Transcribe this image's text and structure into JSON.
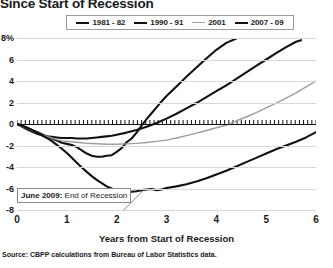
{
  "title": "Since Start of Recession",
  "legend": {
    "position": "top-center",
    "items": [
      {
        "label": "1981 - 82",
        "color": "#111111",
        "width": 2.2
      },
      {
        "label": "1990 - 91",
        "color": "#111111",
        "width": 2.2
      },
      {
        "label": "2001",
        "color": "#9d9d9d",
        "width": 1.6
      },
      {
        "label": "2007 - 09",
        "color": "#111111",
        "width": 2.2
      }
    ]
  },
  "annotation": {
    "bold": "June 2009:",
    "text": " End of Recession"
  },
  "xaxis_title": "Years from Start of Recession",
  "source": "Source: CBPP calculations from Bureau of Labor Statistics data.",
  "chart_data": {
    "type": "line",
    "title": "Since Start of Recession",
    "xlabel": "Years from Start of Recession",
    "ylabel": "",
    "xlim": [
      0,
      6
    ],
    "ylim": [
      -8,
      8
    ],
    "xticks": [
      0,
      1,
      2,
      3,
      4,
      5,
      6
    ],
    "xticklabels": [
      "0",
      "1",
      "2",
      "3",
      "4",
      "5",
      "6"
    ],
    "yticks": [
      -8,
      -6,
      -4,
      -2,
      0,
      2,
      4,
      6,
      8
    ],
    "yticklabels": [
      "-8",
      "-6",
      "-4",
      "-2",
      "0",
      "2",
      "4",
      "6",
      "8%"
    ],
    "grid": true,
    "units": "percent change in payroll employment",
    "series": [
      {
        "name": "1981 - 82",
        "color": "#111111",
        "x": [
          0.0,
          0.1,
          0.2,
          0.3,
          0.4,
          0.5,
          0.6,
          0.7,
          0.8,
          0.9,
          1.0,
          1.1,
          1.2,
          1.3,
          1.4,
          1.5,
          1.6,
          1.7,
          1.8,
          1.9,
          2.0,
          2.1,
          2.2,
          2.3,
          2.4,
          2.5,
          2.6,
          2.7,
          2.8,
          2.9,
          3.0,
          3.2,
          3.4,
          3.6,
          3.8,
          4.0,
          4.2,
          4.4
        ],
        "y": [
          0.0,
          -0.15,
          -0.35,
          -0.55,
          -0.75,
          -0.95,
          -1.15,
          -1.35,
          -1.55,
          -1.75,
          -1.85,
          -1.95,
          -2.15,
          -2.45,
          -2.75,
          -2.95,
          -3.05,
          -3.05,
          -2.95,
          -2.9,
          -2.6,
          -2.25,
          -1.7,
          -1.35,
          -0.8,
          -0.15,
          0.45,
          1.0,
          1.55,
          2.1,
          2.6,
          3.5,
          4.4,
          5.25,
          6.1,
          6.9,
          7.55,
          7.95
        ]
      },
      {
        "name": "1990 - 91",
        "color": "#111111",
        "x": [
          0.0,
          0.1,
          0.2,
          0.3,
          0.4,
          0.5,
          0.6,
          0.7,
          0.8,
          0.9,
          1.0,
          1.1,
          1.2,
          1.3,
          1.4,
          1.5,
          1.6,
          1.7,
          1.8,
          1.9,
          2.0,
          2.2,
          2.4,
          2.6,
          2.8,
          3.0,
          3.2,
          3.4,
          3.6,
          3.8,
          4.0,
          4.2,
          4.4,
          4.6,
          4.8,
          5.0,
          5.2,
          5.4,
          5.6,
          5.7
        ],
        "y": [
          0.0,
          -0.25,
          -0.5,
          -0.7,
          -0.9,
          -1.05,
          -1.15,
          -1.2,
          -1.25,
          -1.3,
          -1.3,
          -1.3,
          -1.35,
          -1.35,
          -1.35,
          -1.3,
          -1.25,
          -1.2,
          -1.15,
          -1.1,
          -1.0,
          -0.8,
          -0.55,
          -0.25,
          0.1,
          0.5,
          0.95,
          1.45,
          1.95,
          2.5,
          3.05,
          3.6,
          4.2,
          4.8,
          5.4,
          6.0,
          6.6,
          7.15,
          7.65,
          7.8
        ]
      },
      {
        "name": "2001",
        "color": "#9d9d9d",
        "x": [
          0.0,
          0.1,
          0.2,
          0.3,
          0.4,
          0.5,
          0.6,
          0.7,
          0.8,
          0.9,
          1.0,
          1.1,
          1.2,
          1.3,
          1.4,
          1.5,
          1.6,
          1.7,
          1.8,
          1.9,
          2.0,
          2.2,
          2.4,
          2.6,
          2.8,
          3.0,
          3.2,
          3.4,
          3.6,
          3.8,
          4.0,
          4.2,
          4.4,
          4.6,
          4.8,
          5.0,
          5.2,
          5.4,
          5.6,
          5.8,
          6.0
        ],
        "y": [
          0.0,
          -0.2,
          -0.4,
          -0.6,
          -0.8,
          -1.0,
          -1.15,
          -1.3,
          -1.45,
          -1.55,
          -1.6,
          -1.65,
          -1.7,
          -1.75,
          -1.8,
          -1.82,
          -1.84,
          -1.86,
          -1.88,
          -1.88,
          -1.88,
          -1.85,
          -1.8,
          -1.72,
          -1.62,
          -1.5,
          -1.3,
          -1.08,
          -0.85,
          -0.6,
          -0.35,
          -0.1,
          0.3,
          0.65,
          1.05,
          1.5,
          1.95,
          2.4,
          2.9,
          3.45,
          4.0
        ]
      },
      {
        "name": "2007 - 09",
        "color": "#111111",
        "x": [
          0.0,
          0.1,
          0.2,
          0.3,
          0.4,
          0.5,
          0.6,
          0.7,
          0.8,
          0.9,
          1.0,
          1.1,
          1.2,
          1.3,
          1.4,
          1.5,
          1.6,
          1.7,
          1.8,
          1.9,
          2.0,
          2.1,
          2.2,
          2.3,
          2.4,
          2.5,
          2.6,
          2.7,
          2.8,
          2.9,
          3.0,
          3.2,
          3.4,
          3.6,
          3.8,
          4.0,
          4.2,
          4.4,
          4.6,
          4.8,
          5.0,
          5.2,
          5.4,
          5.6,
          5.8,
          6.0
        ],
        "y": [
          0.0,
          -0.15,
          -0.35,
          -0.55,
          -0.8,
          -1.05,
          -1.3,
          -1.6,
          -1.95,
          -2.3,
          -2.7,
          -3.15,
          -3.6,
          -4.05,
          -4.45,
          -4.85,
          -5.2,
          -5.5,
          -5.8,
          -6.0,
          -6.15,
          -6.25,
          -6.3,
          -6.3,
          -6.25,
          -6.15,
          -6.1,
          -6.05,
          -6.15,
          -6.1,
          -5.95,
          -5.8,
          -5.6,
          -5.35,
          -5.05,
          -4.7,
          -4.35,
          -3.95,
          -3.55,
          -3.15,
          -2.75,
          -2.35,
          -2.0,
          -1.65,
          -1.25,
          -0.75
        ]
      }
    ]
  }
}
